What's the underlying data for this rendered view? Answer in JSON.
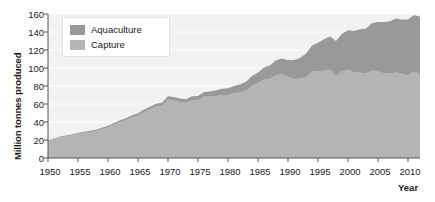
{
  "chart_data": {
    "type": "area",
    "stacked": true,
    "title": "",
    "xlabel": "Year",
    "ylabel": "Million tonnes produced",
    "xlim": [
      1950,
      2012
    ],
    "ylim": [
      0,
      160
    ],
    "xticks": [
      1950,
      1955,
      1960,
      1965,
      1970,
      1975,
      1980,
      1985,
      1990,
      1995,
      2000,
      2005,
      2010
    ],
    "yticks": [
      0,
      20,
      40,
      60,
      80,
      100,
      120,
      140,
      160
    ],
    "grid": "horizontal-white",
    "legend_position": "top-left-inside",
    "legend": [
      "Aquaculture",
      "Capture"
    ],
    "colors": {
      "aquaculture": "#999999",
      "capture": "#b4b4b4",
      "plot_background": "#f2f2f2",
      "gridline": "#ffffff",
      "axis": "#555555",
      "text": "#1a1a1a"
    },
    "x": [
      1950,
      1951,
      1952,
      1953,
      1954,
      1955,
      1956,
      1957,
      1958,
      1959,
      1960,
      1961,
      1962,
      1963,
      1964,
      1965,
      1966,
      1967,
      1968,
      1969,
      1970,
      1971,
      1972,
      1973,
      1974,
      1975,
      1976,
      1977,
      1978,
      1979,
      1980,
      1981,
      1982,
      1983,
      1984,
      1985,
      1986,
      1987,
      1988,
      1989,
      1990,
      1991,
      1992,
      1993,
      1994,
      1995,
      1996,
      1997,
      1998,
      1999,
      2000,
      2001,
      2002,
      2003,
      2004,
      2005,
      2006,
      2007,
      2008,
      2009,
      2010,
      2011,
      2012
    ],
    "series": [
      {
        "name": "Capture",
        "values": [
          19,
          21,
          23,
          24,
          25,
          27,
          28,
          29,
          30,
          32,
          34,
          37,
          40,
          42,
          45,
          47,
          51,
          54,
          57,
          58,
          65,
          64,
          62,
          61,
          64,
          64,
          68,
          68,
          69,
          70,
          70,
          72,
          73,
          75,
          80,
          83,
          87,
          88,
          92,
          93,
          90,
          88,
          88,
          90,
          96,
          96,
          97,
          98,
          91,
          96,
          98,
          95,
          95,
          94,
          97,
          96,
          94,
          94,
          95,
          93,
          92,
          96,
          93
        ]
      },
      {
        "name": "Aquaculture",
        "values": [
          0.6,
          0.7,
          0.8,
          0.9,
          1.0,
          1.1,
          1.2,
          1.3,
          1.4,
          1.5,
          1.7,
          1.8,
          2.0,
          2.2,
          2.4,
          2.6,
          2.8,
          3.0,
          3.2,
          3.4,
          3.6,
          3.8,
          4.1,
          4.4,
          4.7,
          5.0,
          5.4,
          5.8,
          6.3,
          6.9,
          7.4,
          8.0,
          8.8,
          9.7,
          11.0,
          12.0,
          13.5,
          15.0,
          16.5,
          17.5,
          19.0,
          21.0,
          23.0,
          26.0,
          29.0,
          32.0,
          35.0,
          37.0,
          39.0,
          42.0,
          44.0,
          46.0,
          48.0,
          50.0,
          53.0,
          55.0,
          57.0,
          58.0,
          60.0,
          61.0,
          62.0,
          63.0,
          64.0
        ]
      }
    ]
  },
  "axes": {
    "y_title": "Million tonnes produced",
    "x_title": "Year",
    "y_ticks": [
      "160",
      "140",
      "120",
      "100",
      "80",
      "60",
      "40",
      "20",
      "0"
    ],
    "x_ticks": [
      "1950",
      "1955",
      "1960",
      "1965",
      "1970",
      "1975",
      "1980",
      "1985",
      "1990",
      "1995",
      "2000",
      "2005",
      "2010"
    ]
  },
  "legend": {
    "items": [
      {
        "label": "Aquaculture",
        "color": "#999999"
      },
      {
        "label": "Capture",
        "color": "#b4b4b4"
      }
    ]
  }
}
